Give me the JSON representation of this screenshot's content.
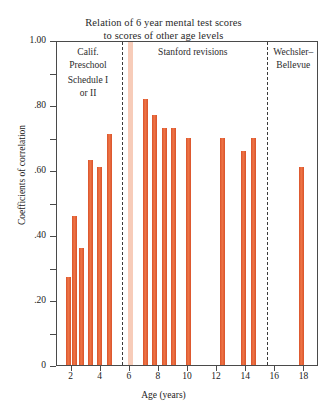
{
  "chart_data": {
    "type": "bar",
    "title": "Relation of 6 year mental test scores to scores of other age levels",
    "title_lines": [
      "Relation of 6 year mental test scores",
      "to scores of other age levels"
    ],
    "xlabel": "Age (years)",
    "ylabel": "Coefficients of correlation",
    "xlim": [
      1,
      19
    ],
    "ylim": [
      0,
      1.0
    ],
    "grid": false,
    "legend": "none",
    "ytick_labels": [
      "1.00",
      ".80",
      ".60",
      ".40",
      ".20",
      "0"
    ],
    "ytick_values": [
      1.0,
      0.8,
      0.6,
      0.4,
      0.2,
      0
    ],
    "yminor_values": [
      0.9,
      0.7,
      0.5,
      0.3,
      0.1
    ],
    "xtick_labels": [
      "2",
      "4",
      "6",
      "8",
      "10",
      "12",
      "14",
      "16",
      "18"
    ],
    "xtick_values": [
      2,
      4,
      6,
      8,
      10,
      12,
      14,
      16,
      18
    ],
    "x": [
      1.8,
      2.2,
      2.7,
      3.3,
      3.9,
      4.6,
      7.1,
      7.7,
      8.4,
      9.0,
      10.0,
      12.4,
      13.8,
      14.5,
      17.8
    ],
    "values": [
      0.27,
      0.46,
      0.36,
      0.63,
      0.61,
      0.71,
      0.82,
      0.77,
      0.73,
      0.73,
      0.7,
      0.7,
      0.66,
      0.7,
      0.61
    ],
    "bar_color": "#d9532a",
    "highlight_band": {
      "x_start": 5.85,
      "x_end": 6.25,
      "color": "#f6c3ad",
      "value": 1.0
    },
    "dividers": [
      5.45,
      15.4
    ],
    "sections": [
      {
        "id": "calif-preschool",
        "lines": [
          "Calif.",
          "Preschool"
        ],
        "lines2": [
          "Schedule I",
          "or II"
        ]
      },
      {
        "id": "stanford-revisions",
        "lines": [
          "Stanford revisions"
        ]
      },
      {
        "id": "wechsler-bellevue",
        "lines": [
          "Wechsler–",
          "Bellevue"
        ]
      }
    ]
  },
  "sections": {
    "calif_line1": "Calif.",
    "calif_line2": "Preschool",
    "calif_line3": "Schedule I",
    "calif_line4": "or II",
    "stanford": "Stanford revisions",
    "wechsler_line1": "Wechsler–",
    "wechsler_line2": "Bellevue"
  }
}
